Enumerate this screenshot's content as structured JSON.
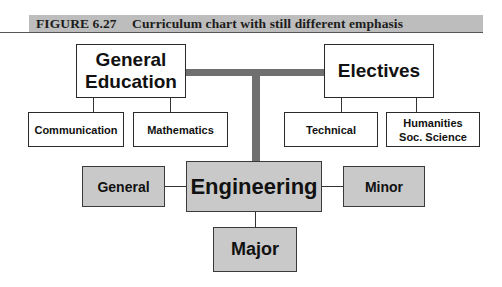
{
  "figure": {
    "number": "FIGURE 6.27",
    "title": "Curriculum chart with still different emphasis"
  },
  "nodes": {
    "general_education": "General Education",
    "general_education_line1": "General",
    "general_education_line2": "Education",
    "electives": "Electives",
    "communication": "Communication",
    "mathematics": "Mathematics",
    "technical": "Technical",
    "humanities_line1": "Humanities",
    "humanities_line2": "Soc. Science",
    "engineering": "Engineering",
    "general": "General",
    "minor": "Minor",
    "major": "Major"
  },
  "colors": {
    "caption_bar": "#bdbdbd",
    "emphasis_fill": "#c9c9c9",
    "emphasis_connector": "#6f6f6f",
    "plain_fill": "#ffffff"
  }
}
